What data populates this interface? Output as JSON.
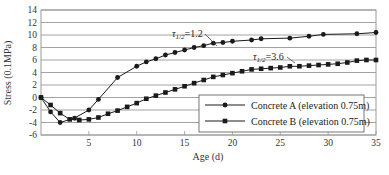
{
  "chart_data": {
    "type": "line",
    "title": "",
    "xlabel": "Age (d)",
    "ylabel": "Stress (0.1MPa)",
    "xlim": [
      0,
      35
    ],
    "ylim": [
      -6,
      14
    ],
    "xticks": [
      5,
      10,
      15,
      20,
      25,
      30,
      35
    ],
    "yticks": [
      -6,
      -4,
      -2,
      0,
      2,
      4,
      6,
      8,
      10,
      12,
      14
    ],
    "grid": "horizontal",
    "legend_position": "lower right",
    "series": [
      {
        "name": "Concrete A (elevation 0.75m)",
        "marker": "circle",
        "x": [
          0,
          1,
          2,
          3.5,
          5,
          6,
          8,
          10,
          11,
          12,
          13,
          14,
          15,
          16,
          17,
          18,
          19,
          20,
          22,
          23,
          26,
          28,
          29.5,
          33,
          35
        ],
        "values": [
          0,
          -2.3,
          -4.0,
          -3.3,
          -2.0,
          -0.3,
          3.2,
          5.0,
          5.7,
          6.2,
          6.8,
          7.2,
          7.6,
          8.0,
          8.3,
          8.7,
          8.8,
          9.0,
          9.2,
          9.4,
          9.5,
          9.8,
          10.1,
          10.2,
          10.4
        ]
      },
      {
        "name": "Concrete B (elevation 0.75m)",
        "marker": "square",
        "x": [
          0,
          1,
          2,
          3,
          4,
          5,
          6,
          7,
          8,
          9,
          10,
          11,
          12,
          13,
          14,
          15,
          16,
          17,
          18,
          19,
          20,
          21,
          22,
          23,
          24,
          25,
          26,
          27,
          28,
          29,
          30,
          31,
          32,
          33,
          34,
          35
        ],
        "values": [
          0,
          -1.2,
          -2.5,
          -3.5,
          -3.6,
          -3.5,
          -3.2,
          -2.6,
          -2.1,
          -1.5,
          -0.9,
          -0.2,
          0.3,
          0.8,
          1.3,
          1.8,
          2.3,
          2.8,
          3.3,
          3.6,
          3.9,
          4.2,
          4.5,
          4.6,
          4.7,
          4.8,
          5.0,
          5.0,
          5.1,
          5.2,
          5.3,
          5.4,
          5.6,
          5.9,
          6.0,
          6.0
        ]
      }
    ],
    "annotations": [
      {
        "text": "τ1/2=1.2",
        "base": "τ",
        "sub": "1/2",
        "rest": "=1.2",
        "target_series": 0,
        "at_x": 17.5
      },
      {
        "text": "τ1/2=3.6",
        "base": "τ",
        "sub": "1/2",
        "rest": "=3.6",
        "target_series": 1,
        "at_x": 26
      }
    ]
  },
  "style": {
    "line_color": "#1a1a1a",
    "grid_color": "#8a8a8a",
    "frame_color": "#9a9a9a",
    "background": "#ffffff"
  }
}
